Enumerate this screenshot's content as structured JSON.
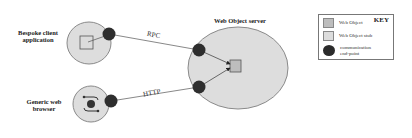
{
  "diagram": {
    "nodes": {
      "client": {
        "label_line1": "Bespoke client",
        "label_line2": "application"
      },
      "browser": {
        "label_line1": "Generic web",
        "label_line2": "browser"
      },
      "server": {
        "label": "Web Object server"
      }
    },
    "edges": {
      "rpc": {
        "label": "RPC"
      },
      "http": {
        "label": "HTTP"
      }
    },
    "key": {
      "title": "KEY",
      "items": [
        {
          "label": "Web Object",
          "swatch": "#bdbdbd",
          "shape": "square"
        },
        {
          "label": "Web Object stub",
          "swatch": "#dcdcdc",
          "shape": "square"
        },
        {
          "label_line1": "communication",
          "label_line2": "end-point",
          "swatch": "#2b2b2b",
          "shape": "circle"
        }
      ]
    },
    "colors": {
      "region_fill": "#dddddd",
      "region_stroke": "#8a8a8a",
      "endpoint": "#2e2e2e",
      "web_object": "#bdbdbd",
      "line": "#555555"
    }
  }
}
